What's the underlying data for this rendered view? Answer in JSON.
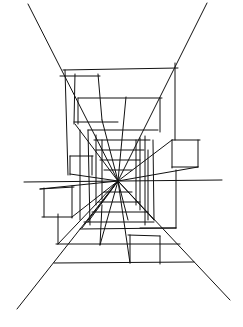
{
  "image": {
    "description": "One-point perspective line sketch of a corridor with box forms converging to a central vanishing point",
    "vanishing_point": [
      118,
      181
    ],
    "stroke_color": "#111111",
    "background": "#ffffff"
  }
}
